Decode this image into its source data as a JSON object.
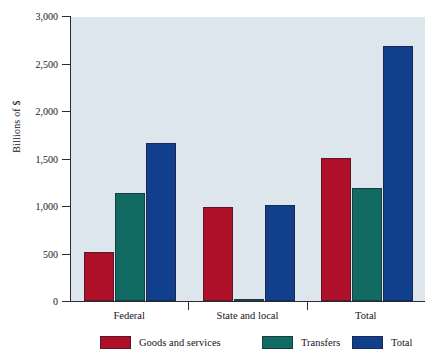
{
  "chart_data": {
    "type": "bar",
    "title": "",
    "xlabel": "",
    "ylabel": "Billions of $",
    "categories": [
      "Federal",
      "State and local",
      "Total"
    ],
    "series": [
      {
        "name": "Goods and services",
        "color": "#AD1028",
        "values": [
          520,
          990,
          1510
        ]
      },
      {
        "name": "Transfers",
        "color": "#126B63",
        "values": [
          1140,
          20,
          1190
        ]
      },
      {
        "name": "Total",
        "color": "#123F8C",
        "values": [
          1660,
          1015,
          2680
        ]
      }
    ],
    "ylim": [
      0,
      3000
    ],
    "yticks": [
      0,
      500,
      1000,
      1500,
      2000,
      2500,
      3000
    ],
    "ytick_labels": [
      "0",
      "500",
      "1,000",
      "1,500",
      "2,000",
      "2,500",
      "3,000"
    ],
    "grid": false,
    "legend_position": "bottom",
    "plot_background": "#DDE6EC",
    "figure_background": "#FFFFFF",
    "axis_color": "#2B2B33"
  }
}
